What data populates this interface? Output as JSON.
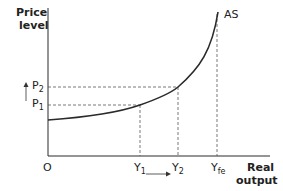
{
  "diagram": {
    "y_axis_label_line1": "Price",
    "y_axis_label_line2": "level",
    "x_axis_label_line1": "Real",
    "x_axis_label_line2": "output",
    "origin_label": "O",
    "curve_label": "AS",
    "price_levels": [
      {
        "base": "P",
        "sub": "2"
      },
      {
        "base": "P",
        "sub": "1"
      }
    ],
    "output_levels": [
      {
        "base": "Y",
        "sub": "1"
      },
      {
        "base": "Y",
        "sub": "2"
      },
      {
        "base": "Y",
        "sub": "fe"
      }
    ],
    "colors": {
      "line": "#2a2a2a",
      "dashed": "#555555"
    }
  }
}
